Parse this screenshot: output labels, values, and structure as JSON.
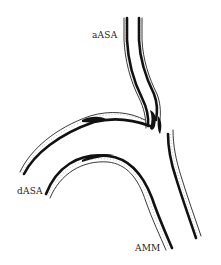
{
  "diagram": {
    "labels": {
      "aASA": "aASA",
      "dASA": "dASA",
      "AMM": "AMM"
    },
    "colors": {
      "background": "#ffffff",
      "vessel_wall": "#111111",
      "label_text": "#222222"
    }
  }
}
